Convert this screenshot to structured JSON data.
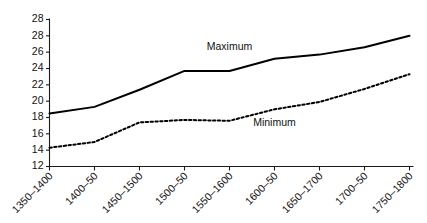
{
  "chart_data": {
    "type": "line",
    "title": "",
    "xlabel": "",
    "ylabel": "",
    "grid": false,
    "legend_position": "inline-annotation",
    "categories": [
      "1350–1400",
      "1400–50",
      "1450–1500",
      "1500–50",
      "1550–1600",
      "1600–50",
      "1650–1700",
      "1700–50",
      "1750–1800"
    ],
    "ylim": [
      12,
      30
    ],
    "yticks": [
      12,
      14,
      16,
      18,
      20,
      22,
      24,
      26,
      28,
      30
    ],
    "ytick_labels": [
      "12",
      "14",
      "16",
      "18",
      "20",
      "22",
      "24",
      "26",
      "28",
      "28"
    ],
    "series": [
      {
        "name": "Maximum",
        "style": "solid",
        "color": "#000000",
        "values": [
          18.5,
          19.3,
          21.4,
          23.7,
          23.7,
          25.2,
          25.7,
          26.6,
          28.0
        ]
      },
      {
        "name": "Minimum",
        "style": "dotted",
        "color": "#000000",
        "values": [
          14.3,
          15.0,
          17.4,
          17.7,
          17.6,
          19.0,
          19.9,
          21.5,
          23.3
        ]
      }
    ],
    "annotations": [
      {
        "text": "Maximum",
        "category_index": 4,
        "value": 26.3
      },
      {
        "text": "Minimum",
        "category_index": 5,
        "value": 17.0
      }
    ]
  }
}
